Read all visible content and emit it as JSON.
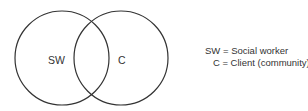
{
  "diagram": {
    "type": "venn",
    "sets": [
      {
        "id": "sw",
        "label": "SW",
        "cx": 62,
        "cy": 58,
        "r": 47
      },
      {
        "id": "c",
        "label": "C",
        "cx": 121,
        "cy": 58,
        "r": 47
      }
    ],
    "stroke_color": "#333333"
  },
  "legend": {
    "line1": "SW = Social worker",
    "line2": "   C = Client (community)"
  }
}
